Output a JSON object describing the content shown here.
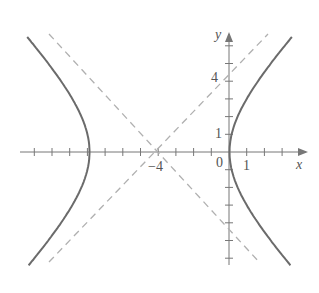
{
  "figure": {
    "type": "hyperbola-graph",
    "equation": "(x+4)^2/16 - y^2/16 = 1",
    "center": [
      -4,
      0
    ],
    "vertices": [
      [
        -8,
        0
      ],
      [
        0,
        0
      ]
    ],
    "asymptotes": [
      "y = x + 4",
      "y = -(x + 4)"
    ],
    "axis_labels": {
      "x": "x",
      "y": "y"
    },
    "tick_labels": {
      "origin": "0",
      "x_one": "1",
      "x_center": "−4",
      "y_one": "1",
      "y_four": "4"
    },
    "colors": {
      "curve": "#6b6b6b",
      "asymptote": "#b0b0b0",
      "axis": "#777777",
      "text": "#555555"
    }
  }
}
